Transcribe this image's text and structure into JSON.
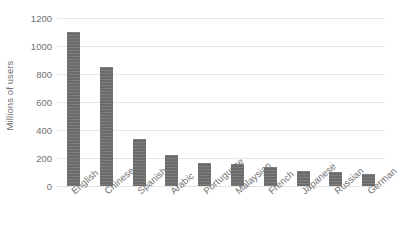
{
  "chart_data": {
    "type": "bar",
    "title": "",
    "subtitle": "",
    "xlabel": "",
    "ylabel": "Millions of users",
    "categories": [
      "English",
      "Chinese",
      "Spanish",
      "Arabic",
      "Portuguese",
      "Malaysian",
      "French",
      "Japanese",
      "Russian",
      "German"
    ],
    "values": [
      1100,
      850,
      335,
      220,
      165,
      160,
      135,
      110,
      100,
      85
    ],
    "series": [
      {
        "name": "Millions of users",
        "values": [
          1100,
          850,
          335,
          220,
          165,
          160,
          135,
          110,
          100,
          85
        ]
      }
    ],
    "ylim": [
      0,
      1200
    ],
    "y_ticks": [
      0,
      200,
      400,
      600,
      800,
      1000,
      1200
    ],
    "y_tick_labels": [
      "0",
      "200",
      "400",
      "600",
      "800",
      "1000",
      "1200"
    ],
    "grid": true,
    "grid_axis": "y",
    "legend": false,
    "legend_position": "none",
    "bar_color": "#6b6b6b",
    "gridline_color": "#e9e9e9",
    "text_color": "#6f6f6f",
    "background_color": "#ffffff",
    "x_tick_label_rotation": -41
  }
}
